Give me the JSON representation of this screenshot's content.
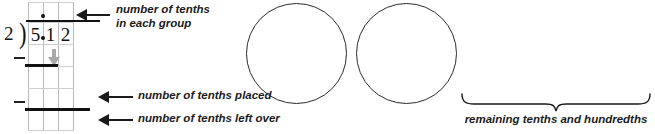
{
  "diagram": {
    "colors": {
      "ink": "#1a1a1a",
      "gridline": "#b9b9b9",
      "bringdown_arrow": "#a8a8a8",
      "circle_stroke": "#2b2b2b",
      "background": "#ffffff"
    }
  },
  "division": {
    "divisor": "2",
    "paren": ")",
    "dividend_digits": [
      "5",
      "1",
      "2"
    ],
    "dividend_decimal": ".",
    "quotient_decimal": ".",
    "quotient_digits": [
      "",
      "",
      ""
    ],
    "minus_sign_upper": "–",
    "minus_sign_lower": "–",
    "bringdown_arrow": "down-arrow"
  },
  "annotations": [
    {
      "id": "tenths-each-group",
      "text": "number of tenths\nin each group",
      "arrow": "left-arrow"
    },
    {
      "id": "tenths-placed",
      "text": "number of tenths placed",
      "arrow": "left-arrow"
    },
    {
      "id": "tenths-left-over",
      "text": "number of tenths left over",
      "arrow": "left-arrow"
    }
  ],
  "groups": {
    "count": 2,
    "circles": [
      "group-circle-1",
      "group-circle-2"
    ]
  },
  "brace": {
    "shape": "curly-brace-down",
    "caption": "remaining tenths and hundredths"
  }
}
